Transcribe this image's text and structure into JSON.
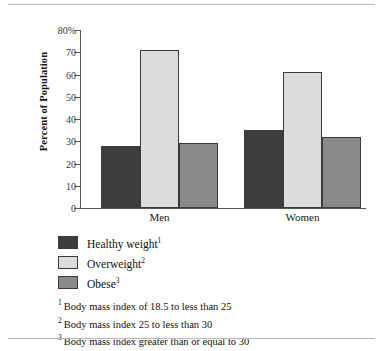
{
  "chart_data": {
    "type": "bar",
    "title": "",
    "xlabel": "",
    "ylabel": "Percent of Population",
    "ylim": [
      0,
      80
    ],
    "grid": false,
    "legend_position": "below-left",
    "categories": [
      "Men",
      "Women"
    ],
    "ytick_labels": [
      "80%",
      "70",
      "60",
      "50",
      "40",
      "30",
      "20",
      "10",
      "0"
    ],
    "ytick_values": [
      80,
      70,
      60,
      50,
      40,
      30,
      20,
      10,
      0
    ],
    "series": [
      {
        "name": "Healthy weight",
        "marker": "1",
        "color": "#3d3d3d",
        "values": [
          28,
          35
        ]
      },
      {
        "name": "Overweight",
        "marker": "2",
        "color": "#dcdcdc",
        "values": [
          71,
          61
        ]
      },
      {
        "name": "Obese",
        "marker": "3",
        "color": "#8a8a8a",
        "values": [
          29,
          32
        ]
      }
    ],
    "annotations": [
      "1 Body mass index of 18.5 to less than 25",
      "2 Body mass index 25 to less than 30",
      "3 Body mass index greater than or equal to 30"
    ]
  },
  "legend": {
    "items": [
      {
        "label": "Healthy weight",
        "marker": "1"
      },
      {
        "label": "Overweight",
        "marker": "2"
      },
      {
        "label": "Obese",
        "marker": "3"
      }
    ]
  },
  "footnotes": [
    {
      "marker": "1",
      "text": "Body mass index of 18.5 to less than 25"
    },
    {
      "marker": "2",
      "text": "Body mass index 25 to less than 30"
    },
    {
      "marker": "3",
      "text": "Body mass index greater than or equal to 30"
    }
  ]
}
